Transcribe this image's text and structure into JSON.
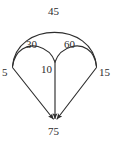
{
  "figure": {
    "type": "directed-graph-diagram",
    "background_color": "#ffffff",
    "stroke_color": "#2e2e2e",
    "text_color": "#2b2b2b"
  },
  "nodes": [
    {
      "id": "left",
      "label": "5",
      "x": 12,
      "y": 67
    },
    {
      "id": "middle",
      "label": "10",
      "x": 55,
      "y": 62
    },
    {
      "id": "right",
      "label": "15",
      "x": 97,
      "y": 67
    },
    {
      "id": "bottom",
      "label": "75",
      "x": 55,
      "y": 122
    }
  ],
  "edges": [
    {
      "id": "arc-outer",
      "label": "45",
      "from": "left",
      "to": "right",
      "shape": "arc"
    },
    {
      "id": "arc-left",
      "label": "30",
      "from": "left",
      "to": "middle",
      "shape": "arc"
    },
    {
      "id": "arc-right",
      "label": "60",
      "from": "middle",
      "to": "right",
      "shape": "arc"
    },
    {
      "id": "line-left",
      "label": "",
      "from": "left",
      "to": "bottom",
      "shape": "line",
      "arrow": true
    },
    {
      "id": "line-mid",
      "label": "",
      "from": "middle",
      "to": "bottom",
      "shape": "line",
      "arrow": true
    },
    {
      "id": "line-right",
      "label": "",
      "from": "right",
      "to": "bottom",
      "shape": "line",
      "arrow": true
    }
  ],
  "labels": {
    "outer_arc": "45",
    "left_arc": "30",
    "right_arc": "60",
    "left_node": "5",
    "middle_node": "10",
    "right_node": "15",
    "bottom_node": "75"
  }
}
